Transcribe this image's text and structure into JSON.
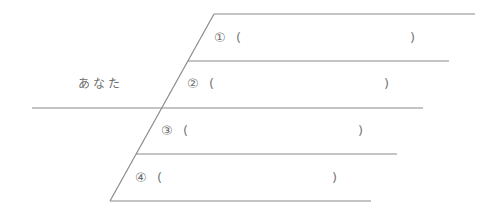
{
  "diagram": {
    "left_label": "あなた",
    "line_color": "#8a8a8a",
    "items": [
      {
        "num": "①",
        "open": "(",
        "close": ")",
        "value": ""
      },
      {
        "num": "②",
        "open": "(",
        "close": ")",
        "value": ""
      },
      {
        "num": "③",
        "open": "(",
        "close": ")",
        "value": ""
      },
      {
        "num": "④",
        "open": "(",
        "close": ")",
        "value": ""
      }
    ]
  }
}
